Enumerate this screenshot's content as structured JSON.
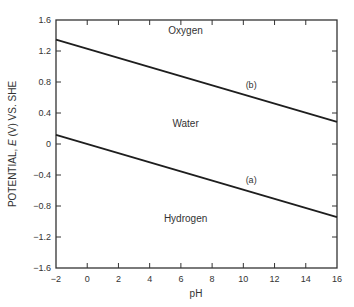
{
  "chart_data": {
    "type": "line",
    "title": "",
    "xlabel": "pH",
    "ylabel_parts": [
      "POTENTIAL, ",
      "E",
      " (V) VS. SHE"
    ],
    "ylabel": "POTENTIAL, E (V) VS. SHE",
    "xlim": [
      -2,
      16
    ],
    "ylim": [
      -1.6,
      1.6
    ],
    "x_ticks": [
      -2,
      0,
      2,
      4,
      6,
      8,
      10,
      12,
      14,
      16
    ],
    "x_tick_labels": [
      "−2",
      "0",
      "2",
      "4",
      "6",
      "8",
      "10",
      "12",
      "14",
      "16"
    ],
    "y_ticks": [
      1.6,
      1.2,
      0.8,
      0.4,
      0,
      -0.4,
      -0.8,
      -1.2,
      -1.6
    ],
    "y_tick_labels": [
      "1.6",
      "1.2",
      "0.8",
      "0.4",
      "0",
      "−0.4",
      "−0.8",
      "−1.2",
      "−1.6"
    ],
    "grid": false,
    "series": [
      {
        "name": "(b)",
        "x": [
          -2,
          16
        ],
        "values": [
          1.348,
          0.286
        ],
        "label_at": [
          10.5,
          0.72
        ]
      },
      {
        "name": "(a)",
        "x": [
          -2,
          16
        ],
        "values": [
          0.118,
          -0.944
        ],
        "label_at": [
          10.5,
          -0.5
        ]
      }
    ],
    "annotations": [
      {
        "text": "Oxygen",
        "x": 6.3,
        "y": 1.42
      },
      {
        "text": "Water",
        "x": 6.3,
        "y": 0.22
      },
      {
        "text": "Hydrogen",
        "x": 6.3,
        "y": -1.0
      }
    ],
    "colors": {
      "line": "#1e1e1e",
      "axis": "#333333",
      "text": "#333333"
    }
  }
}
